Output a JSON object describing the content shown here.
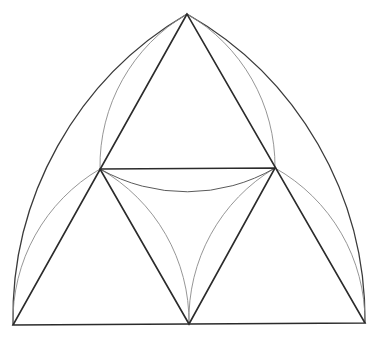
{
  "diagram": {
    "type": "geometric-construction",
    "points": {
      "apex": [
        187,
        14
      ],
      "left_mid": [
        100,
        169
      ],
      "right_mid": [
        275,
        168
      ],
      "bottom_left": [
        13,
        325
      ],
      "bottom_mid": [
        189,
        324
      ],
      "bottom_right": [
        365,
        323
      ]
    },
    "colors": {
      "background": "#ffffff",
      "heavy_line": "#2b2b2b",
      "outer_arc": "#3a3a3a",
      "light_arc": "#8a8a8a"
    }
  }
}
